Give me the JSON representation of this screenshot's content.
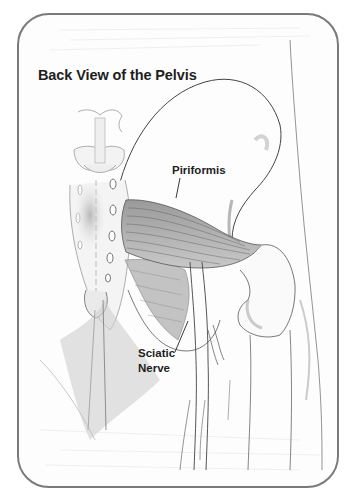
{
  "diagram": {
    "title": "Back View of the Pelvis",
    "labels": {
      "piriformis": "Piriformis",
      "sciatic_line1": "Sciatic",
      "sciatic_line2": "Nerve"
    },
    "frame": {
      "border_color": "#7a7a7a",
      "corner_radius": 32
    },
    "style": "pencil anatomical sketch",
    "structures": [
      "sacrum",
      "lumbar vertebrae",
      "ilium",
      "femur head",
      "femur shaft",
      "piriformis muscle",
      "sciatic nerve",
      "gluteal muscles"
    ]
  }
}
